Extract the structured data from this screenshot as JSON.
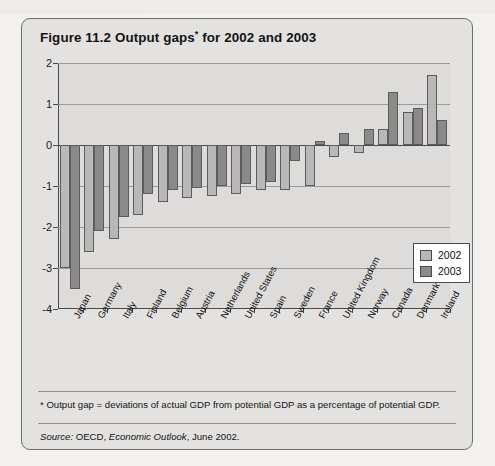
{
  "figure": {
    "title_main": "Figure 11.2  Output gaps",
    "title_sup": "*",
    "title_rest": " for 2002 and 2003",
    "footnote": "* Output gap = deviations of actual GDP from potential GDP as a percentage of potential GDP.",
    "source_label": "Source:",
    "source_text": " OECD, ",
    "source_italic": "Economic Outlook",
    "source_tail": ", June 2002."
  },
  "legend": {
    "position": "inside-right",
    "entries": [
      {
        "label": "2002",
        "color": "#b9b8b6"
      },
      {
        "label": "2003",
        "color": "#8b8a89"
      }
    ]
  },
  "chart_data": {
    "type": "bar",
    "title": "Figure 11.2  Output gaps* for 2002 and 2003",
    "xlabel": "",
    "ylabel": "",
    "ylim": [
      -4,
      2
    ],
    "yticks": [
      2,
      1,
      0,
      -1,
      -2,
      -3,
      -4
    ],
    "ytick_labels": [
      "2",
      "1",
      "0",
      "-1",
      "-2",
      "-3",
      "-4"
    ],
    "grid": true,
    "categories": [
      "Japan",
      "Germany",
      "Italy",
      "Finland",
      "Belgium",
      "Austria",
      "Netherlands",
      "United States",
      "Spain",
      "Sweden",
      "France",
      "United Kingdom",
      "Norway",
      "Canada",
      "Denmark",
      "Ireland"
    ],
    "series": [
      {
        "name": "2002",
        "color": "#b9b8b6",
        "values": [
          -3.0,
          -2.6,
          -2.3,
          -1.7,
          -1.4,
          -1.3,
          -1.25,
          -1.2,
          -1.1,
          -1.1,
          -1.0,
          -0.3,
          -0.2,
          0.4,
          0.8,
          1.7
        ]
      },
      {
        "name": "2003",
        "color": "#8b8a89",
        "values": [
          -3.5,
          -2.1,
          -1.75,
          -1.2,
          -1.1,
          -1.05,
          -1.0,
          -0.95,
          -0.9,
          -0.4,
          0.1,
          0.3,
          0.4,
          1.3,
          0.9,
          0.6
        ]
      }
    ]
  }
}
